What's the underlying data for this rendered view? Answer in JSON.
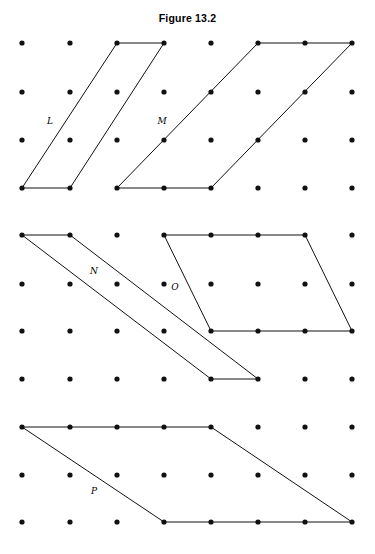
{
  "figure": {
    "title": "Figure 13.2",
    "width": 375,
    "height": 554,
    "background_color": "#ffffff",
    "ink_color": "#000000"
  },
  "chart_data": {
    "type": "scatter",
    "title": "Figure 13.2",
    "subtitle": "",
    "xlabel": "",
    "ylabel": "",
    "grid": false,
    "legend_position": "none",
    "lattice": {
      "columns": 8,
      "rows": 11,
      "column_x": [
        22,
        70,
        117,
        164,
        211,
        258,
        305,
        352
      ],
      "row_y": [
        43,
        92,
        140,
        188,
        235,
        284,
        331,
        379,
        427,
        475,
        522
      ],
      "dot_radius": 2.6,
      "dot_color": "#111111",
      "spacing_x": 47,
      "spacing_y": 48
    },
    "shapes": [
      {
        "name": "L",
        "label": "L",
        "label_x": 50,
        "label_y": 124,
        "stroke": "#111111",
        "stroke_width": 1,
        "fill": "none",
        "points": [
          [
            22,
            188
          ],
          [
            70,
            188
          ],
          [
            164,
            43
          ],
          [
            117,
            43
          ]
        ],
        "grid_points": [
          [
            0,
            3
          ],
          [
            1,
            3
          ],
          [
            3,
            0
          ],
          [
            2,
            0
          ]
        ]
      },
      {
        "name": "M",
        "label": "M",
        "label_x": 162,
        "label_y": 124,
        "stroke": "#111111",
        "stroke_width": 1,
        "fill": "none",
        "points": [
          [
            117,
            188
          ],
          [
            211,
            188
          ],
          [
            352,
            43
          ],
          [
            258,
            43
          ]
        ],
        "grid_points": [
          [
            2,
            3
          ],
          [
            4,
            3
          ],
          [
            7,
            0
          ],
          [
            5,
            0
          ]
        ]
      },
      {
        "name": "N",
        "label": "N",
        "label_x": 94,
        "label_y": 274,
        "stroke": "#111111",
        "stroke_width": 1,
        "fill": "none",
        "points": [
          [
            22,
            235
          ],
          [
            70,
            235
          ],
          [
            258,
            379
          ],
          [
            211,
            379
          ]
        ],
        "grid_points": [
          [
            0,
            4
          ],
          [
            1,
            4
          ],
          [
            5,
            7
          ],
          [
            4,
            7
          ]
        ]
      },
      {
        "name": "O",
        "label": "O",
        "label_x": 175,
        "label_y": 290,
        "stroke": "#111111",
        "stroke_width": 1,
        "fill": "none",
        "points": [
          [
            164,
            235
          ],
          [
            305,
            235
          ],
          [
            352,
            331
          ],
          [
            211,
            331
          ]
        ],
        "grid_points": [
          [
            3,
            4
          ],
          [
            6,
            4
          ],
          [
            7,
            6
          ],
          [
            4,
            6
          ]
        ]
      },
      {
        "name": "P",
        "label": "P",
        "label_x": 94,
        "label_y": 494,
        "stroke": "#111111",
        "stroke_width": 1,
        "fill": "none",
        "points": [
          [
            22,
            427
          ],
          [
            211,
            427
          ],
          [
            352,
            522
          ],
          [
            164,
            522
          ]
        ],
        "grid_points": [
          [
            0,
            8
          ],
          [
            4,
            8
          ],
          [
            7,
            10
          ],
          [
            3,
            10
          ]
        ]
      }
    ]
  }
}
